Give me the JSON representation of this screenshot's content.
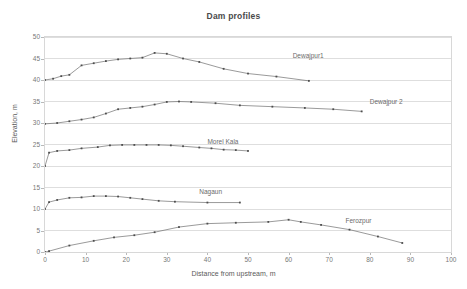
{
  "chart_data": {
    "type": "line",
    "title": "Dam profiles",
    "xlabel": "Distance from upstream, m",
    "ylabel": "Elevation, m",
    "xlim": [
      0,
      100
    ],
    "ylim": [
      0,
      50
    ],
    "xticks": [
      "0",
      "10",
      "20",
      "30",
      "40",
      "50",
      "60",
      "70",
      "80",
      "90",
      "100"
    ],
    "yticks": [
      "0",
      "5",
      "10",
      "15",
      "20",
      "25",
      "30",
      "35",
      "40",
      "45",
      "50"
    ],
    "grid": "horizontal",
    "legend": "inline-labels",
    "line_color": "#6e6e6e",
    "marker_color": "#4d4d4d",
    "series": [
      {
        "name": "Dewajpur1",
        "label_x": 61,
        "label_y": 45.6,
        "x": [
          0,
          2,
          4,
          6,
          9,
          12,
          15,
          18,
          21,
          24,
          27,
          30,
          34,
          38,
          44,
          50,
          57,
          65
        ],
        "y": [
          40.0,
          40.3,
          40.9,
          41.2,
          43.4,
          43.9,
          44.4,
          44.8,
          45.0,
          45.2,
          46.3,
          46.1,
          45.0,
          44.2,
          42.6,
          41.5,
          40.8,
          39.8
        ]
      },
      {
        "name": "Dewajpur 2",
        "label_x": 80,
        "label_y": 34.8,
        "x": [
          0,
          3,
          6,
          9,
          12,
          15,
          18,
          21,
          24,
          27,
          30,
          33,
          36,
          42,
          48,
          56,
          64,
          71,
          78
        ],
        "y": [
          29.8,
          30.0,
          30.4,
          30.8,
          31.3,
          32.2,
          33.2,
          33.5,
          33.8,
          34.3,
          34.9,
          35.0,
          34.9,
          34.6,
          34.1,
          33.8,
          33.5,
          33.2,
          32.7
        ]
      },
      {
        "name": "Morel Kala",
        "label_x": 40,
        "label_y": 25.6,
        "x": [
          0,
          1,
          3,
          6,
          9,
          13,
          16,
          19,
          22,
          25,
          28,
          31,
          34,
          38,
          41,
          44,
          47,
          50
        ],
        "y": [
          20.0,
          23.1,
          23.5,
          23.7,
          24.1,
          24.4,
          24.8,
          24.9,
          24.9,
          24.9,
          24.9,
          24.8,
          24.6,
          24.3,
          24.1,
          23.8,
          23.7,
          23.5
        ]
      },
      {
        "name": "Nagaun",
        "label_x": 38,
        "label_y": 13.9,
        "x": [
          0,
          1,
          3,
          6,
          9,
          12,
          15,
          18,
          21,
          24,
          28,
          32,
          40,
          48
        ],
        "y": [
          10.0,
          11.6,
          12.1,
          12.6,
          12.7,
          13.0,
          13.0,
          12.9,
          12.6,
          12.3,
          11.9,
          11.7,
          11.5,
          11.5
        ]
      },
      {
        "name": "Ferozpur",
        "label_x": 74,
        "label_y": 7.2,
        "x": [
          0,
          1,
          6,
          12,
          17,
          22,
          27,
          33,
          40,
          47,
          55,
          60,
          63,
          68,
          75,
          82,
          88
        ],
        "y": [
          0.0,
          0.2,
          1.5,
          2.6,
          3.4,
          3.9,
          4.6,
          5.8,
          6.6,
          6.8,
          7.0,
          7.5,
          7.0,
          6.3,
          5.2,
          3.6,
          2.1
        ]
      }
    ]
  }
}
